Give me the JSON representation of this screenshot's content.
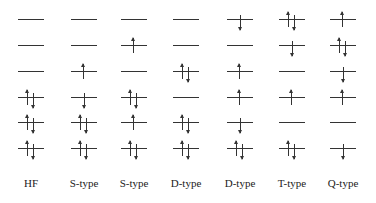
{
  "diagram": {
    "type": "orbital-occupation",
    "level_y": [
      19,
      45,
      71,
      97,
      122,
      148
    ],
    "columns": [
      {
        "label": "HF",
        "x": 31,
        "levels": [
          "empty",
          "empty",
          "empty",
          "updown",
          "updown",
          "updown"
        ]
      },
      {
        "label": "S-type",
        "x": 84,
        "levels": [
          "empty",
          "empty",
          "up",
          "down",
          "updown",
          "updown"
        ]
      },
      {
        "label": "S-type",
        "x": 134,
        "levels": [
          "empty",
          "up",
          "empty",
          "updown",
          "up",
          "updown"
        ]
      },
      {
        "label": "D-type",
        "x": 186,
        "levels": [
          "empty",
          "empty",
          "updown",
          "empty",
          "updown",
          "updown"
        ]
      },
      {
        "label": "D-type",
        "x": 240,
        "levels": [
          "down",
          "empty",
          "up",
          "up",
          "down",
          "updown"
        ]
      },
      {
        "label": "T-type",
        "x": 292,
        "levels": [
          "updown",
          "down",
          "empty",
          "up",
          "empty",
          "updown"
        ]
      },
      {
        "label": "Q-type",
        "x": 343,
        "levels": [
          "up",
          "updown",
          "down",
          "up",
          "empty",
          "down"
        ]
      }
    ],
    "colors": {
      "line": "#333333",
      "background": "#ffffff"
    }
  }
}
